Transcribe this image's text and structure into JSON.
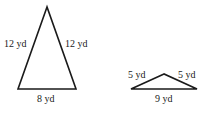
{
  "triangles": [
    {
      "name": "tall-isosceles",
      "vertices": [
        [
          47,
          7
        ],
        [
          18,
          89
        ],
        [
          76,
          89
        ]
      ],
      "labels": {
        "left": "12 yd",
        "right": "12 yd",
        "base": "8 yd"
      }
    },
    {
      "name": "flat-isosceles",
      "vertices": [
        [
          164,
          74
        ],
        [
          131,
          89
        ],
        [
          197,
          89
        ]
      ],
      "labels": {
        "left": "5 yd",
        "right": "5 yd",
        "base": "9 yd"
      }
    }
  ],
  "colors": {
    "stroke": "#1a1a1a",
    "background": "#ffffff"
  }
}
